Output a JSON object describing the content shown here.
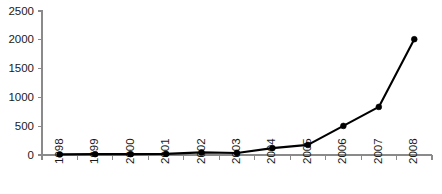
{
  "chart_data": {
    "type": "line",
    "title": "",
    "subtitle": "",
    "xlabel": "",
    "ylabel": "",
    "x": [
      "1998",
      "1999",
      "2000",
      "2001",
      "2002",
      "2003",
      "2004",
      "2005",
      "2006",
      "2007",
      "2008"
    ],
    "categories": [
      "1998",
      "1999",
      "2000",
      "2001",
      "2002",
      "2003",
      "2004",
      "2005",
      "2006",
      "2007",
      "2008"
    ],
    "values": [
      10,
      15,
      15,
      20,
      45,
      35,
      120,
      175,
      505,
      835,
      2010
    ],
    "series": [
      {
        "name": "",
        "values": [
          10,
          15,
          15,
          20,
          45,
          35,
          120,
          175,
          505,
          835,
          2010
        ]
      }
    ],
    "ylim": [
      0,
      2500
    ],
    "yticks": [
      0,
      500,
      1000,
      1500,
      2000,
      2500
    ],
    "ytick_labels": [
      "0",
      "500",
      "1000",
      "1500",
      "2000",
      "2500"
    ],
    "xtick_labels": [
      "1998",
      "1999",
      "2000",
      "2001",
      "2002",
      "2003",
      "2004",
      "2005",
      "2006",
      "2007",
      "2008"
    ],
    "xtick_rotation": 90,
    "grid": false,
    "legend": false,
    "legend_position": "none",
    "annotations": [],
    "colors": {
      "line": "#000000",
      "marker": "#000000",
      "axis": "#8a8a8a",
      "text": "#1a1a1a",
      "background": "#ffffff"
    }
  },
  "layout": {
    "plot_left": 42,
    "plot_right": 432,
    "plot_top": 11,
    "plot_bottom": 155,
    "width": 442,
    "height": 194
  }
}
